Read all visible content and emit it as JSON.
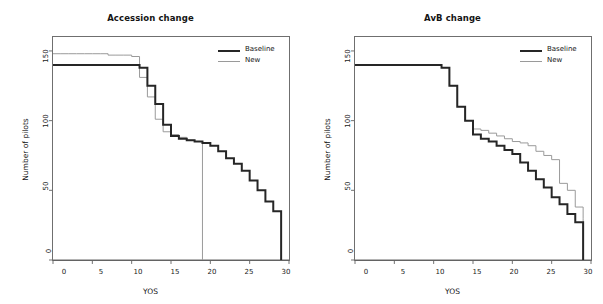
{
  "figure": {
    "background": "#ffffff",
    "panel_count": 2
  },
  "colors": {
    "baseline": "#262626",
    "new": "#9a9a9a",
    "axis": "#6f6f6f",
    "text": "#141414"
  },
  "chart_data": [
    {
      "type": "line",
      "step": true,
      "title": "Accession change",
      "xlabel": "YOS",
      "ylabel": "Number of pilots",
      "xlim": [
        0,
        30
      ],
      "ylim": [
        0,
        160
      ],
      "xticks": [
        0,
        5,
        10,
        15,
        20,
        25,
        30
      ],
      "yticks": [
        0,
        50,
        100,
        150
      ],
      "grid": false,
      "legend_position": "top-right",
      "legend": [
        "Baseline",
        "New"
      ],
      "series": [
        {
          "name": "Baseline",
          "color": "#262626",
          "x": [
            0,
            1,
            2,
            3,
            4,
            5,
            6,
            7,
            8,
            9,
            10,
            11,
            12,
            13,
            14,
            15,
            16,
            17,
            18,
            19,
            20,
            21,
            22,
            23,
            24,
            25,
            26,
            27,
            28,
            29
          ],
          "values": [
            140,
            140,
            140,
            140,
            140,
            140,
            140,
            140,
            140,
            140,
            140,
            138,
            125,
            112,
            97,
            89,
            87,
            86,
            85,
            84,
            82,
            78,
            73,
            69,
            64,
            57,
            50,
            42,
            35,
            22
          ]
        },
        {
          "name": "New",
          "color": "#9a9a9a",
          "x": [
            0,
            1,
            2,
            3,
            4,
            5,
            6,
            7,
            8,
            9,
            10,
            11,
            12,
            13,
            14,
            15,
            16,
            17,
            18,
            19
          ],
          "values": [
            148,
            148,
            148,
            148,
            148,
            148,
            148,
            147,
            147,
            147,
            146,
            131,
            117,
            101,
            92,
            90,
            88,
            86,
            85,
            84
          ]
        }
      ]
    },
    {
      "type": "line",
      "step": true,
      "title": "AvB change",
      "xlabel": "YOS",
      "ylabel": "Number of pilots",
      "xlim": [
        0,
        30
      ],
      "ylim": [
        0,
        160
      ],
      "xticks": [
        0,
        5,
        10,
        15,
        20,
        25,
        30
      ],
      "yticks": [
        0,
        50,
        100,
        150
      ],
      "grid": false,
      "legend_position": "top-right",
      "legend": [
        "Baseline",
        "New"
      ],
      "series": [
        {
          "name": "Baseline",
          "color": "#262626",
          "x": [
            0,
            1,
            2,
            3,
            4,
            5,
            6,
            7,
            8,
            9,
            10,
            11,
            12,
            13,
            14,
            15,
            16,
            17,
            18,
            19,
            20,
            21,
            22,
            23,
            24,
            25,
            26,
            27,
            28,
            29
          ],
          "values": [
            140,
            140,
            140,
            140,
            140,
            140,
            140,
            140,
            140,
            140,
            140,
            138,
            125,
            110,
            100,
            90,
            87,
            85,
            82,
            79,
            76,
            70,
            64,
            58,
            52,
            45,
            40,
            33,
            27,
            17
          ]
        },
        {
          "name": "New",
          "color": "#9a9a9a",
          "x": [
            11,
            12,
            13,
            14,
            15,
            16,
            17,
            18,
            19,
            20,
            21,
            22,
            23,
            24,
            25,
            26,
            27,
            28,
            29
          ],
          "values": [
            138,
            125,
            110,
            100,
            94,
            93,
            91,
            89,
            87,
            85,
            84,
            82,
            78,
            75,
            72,
            55,
            50,
            38,
            30
          ]
        }
      ]
    }
  ],
  "panels": [
    {
      "id": "accession-change",
      "title": "Accession change",
      "xlabel": "YOS",
      "ylabel": "Number of pilots",
      "xticks": [
        "0",
        "5",
        "10",
        "15",
        "20",
        "25",
        "30"
      ],
      "yticks": [
        "0",
        "50",
        "100",
        "150"
      ],
      "legend": [
        {
          "label": "Baseline",
          "style": "thick-black"
        },
        {
          "label": "New",
          "style": "thin-gray"
        }
      ]
    },
    {
      "id": "avb-change",
      "title": "AvB change",
      "xlabel": "YOS",
      "ylabel": "Number of pilots",
      "xticks": [
        "0",
        "5",
        "10",
        "15",
        "20",
        "25",
        "30"
      ],
      "yticks": [
        "0",
        "50",
        "100",
        "150"
      ],
      "legend": [
        {
          "label": "Baseline",
          "style": "thick-black"
        },
        {
          "label": "New",
          "style": "thin-gray"
        }
      ]
    }
  ]
}
